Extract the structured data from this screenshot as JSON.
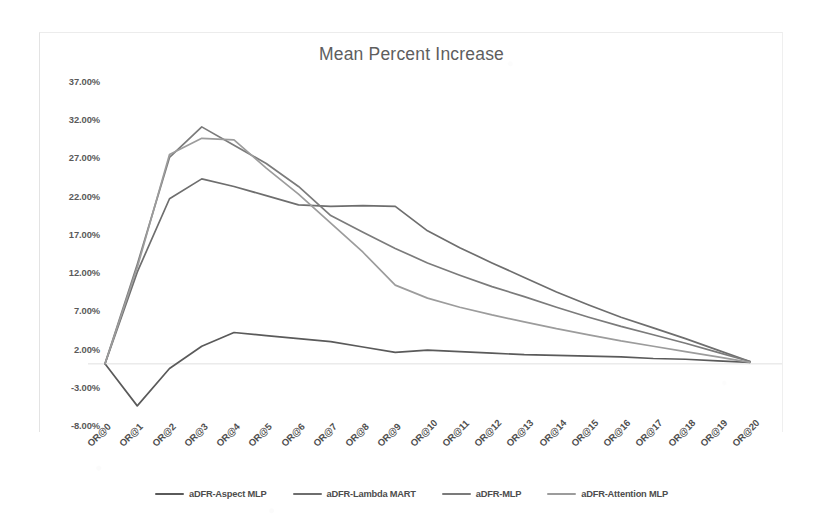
{
  "chart_data": {
    "type": "line",
    "title": "Mean Percent Increase",
    "xlabel": "",
    "ylabel": "",
    "grid": false,
    "legend_position": "bottom",
    "ylim": [
      -8,
      37
    ],
    "ytick_labels": [
      "37.00%",
      "32.00%",
      "27.00%",
      "22.00%",
      "17.00%",
      "12.00%",
      "7.00%",
      "2.00%",
      "-3.00%",
      "-8.00%"
    ],
    "ytick_values": [
      37,
      32,
      27,
      22,
      17,
      12,
      7,
      2,
      -3,
      -8
    ],
    "categories": [
      "OR@0",
      "OR@1",
      "OR@2",
      "OR@3",
      "OR@4",
      "OR@5",
      "OR@6",
      "OR@7",
      "OR@8",
      "OR@9",
      "OR@10",
      "OR@11",
      "OR@12",
      "OR@13",
      "OR@14",
      "OR@15",
      "OR@16",
      "OR@17",
      "OR@18",
      "OR@19",
      "OR@20"
    ],
    "series": [
      {
        "name": "aDFR-Aspect MLP",
        "color": "#5a5a5a",
        "values": [
          0.0,
          -5.5,
          -0.6,
          2.3,
          4.1,
          3.7,
          3.3,
          2.9,
          2.2,
          1.5,
          1.8,
          1.6,
          1.4,
          1.2,
          1.1,
          1.0,
          0.9,
          0.7,
          0.6,
          0.4,
          0.2
        ]
      },
      {
        "name": "aDFR-Lambda MART",
        "color": "#6e6e6e",
        "values": [
          0.0,
          12.0,
          21.6,
          24.2,
          23.2,
          22.0,
          20.8,
          20.6,
          20.7,
          20.6,
          17.4,
          15.2,
          13.2,
          11.3,
          9.4,
          7.7,
          6.1,
          4.7,
          3.3,
          1.8,
          0.3
        ]
      },
      {
        "name": "aDFR-MLP",
        "color": "#7b7b7b",
        "values": [
          0.0,
          13.0,
          27.0,
          31.0,
          28.6,
          26.2,
          23.2,
          19.4,
          17.2,
          15.1,
          13.2,
          11.6,
          10.1,
          8.8,
          7.4,
          6.1,
          4.9,
          3.8,
          2.7,
          1.5,
          0.3
        ]
      },
      {
        "name": "aDFR-Attention MLP",
        "color": "#9c9c9c",
        "values": [
          0.0,
          12.6,
          27.4,
          29.5,
          29.3,
          25.6,
          22.2,
          18.4,
          14.6,
          10.3,
          8.6,
          7.4,
          6.4,
          5.5,
          4.6,
          3.8,
          3.0,
          2.3,
          1.6,
          0.9,
          0.2
        ]
      }
    ]
  },
  "axis": {
    "zero_line_color": "#e0e0e0"
  }
}
